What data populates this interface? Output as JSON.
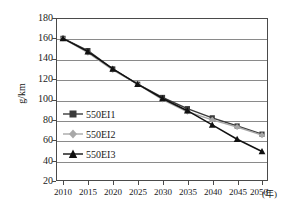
{
  "chart_data": {
    "type": "line",
    "title": "",
    "xlabel": "(年)",
    "ylabel": "g/km",
    "x": [
      2010,
      2015,
      2020,
      2025,
      2030,
      2035,
      2040,
      2045,
      2050
    ],
    "xticklabels": [
      "2010",
      "2015",
      "2020",
      "2025",
      "2030",
      "2035",
      "2040",
      "2045",
      "2050"
    ],
    "xunit": "(年)",
    "yticklabels": [
      "180",
      "160",
      "140",
      "120",
      "100",
      "80",
      "60",
      "40",
      "20"
    ],
    "yticks": [
      180,
      160,
      140,
      120,
      100,
      80,
      60,
      40,
      20
    ],
    "ylim": [
      20,
      180
    ],
    "xlim": [
      2008,
      2052
    ],
    "grid": "horizontal",
    "legend_position": "inside-left",
    "series": [
      {
        "name": "550EI1",
        "marker": "square",
        "color": "#3b3b3b",
        "values": [
          160,
          148,
          130,
          115,
          102,
          91,
          82,
          74,
          66
        ]
      },
      {
        "name": "550EI2",
        "marker": "diamond",
        "color": "#a8a8a8",
        "values": [
          160,
          146,
          129,
          115,
          100,
          88,
          80,
          73,
          65
        ]
      },
      {
        "name": "550EI3",
        "marker": "triangle",
        "color": "#111111",
        "values": [
          160,
          147,
          130,
          115,
          101,
          89,
          75,
          61,
          49
        ]
      }
    ]
  },
  "axes": {
    "y_label": "g/km",
    "y_tick_0": "180",
    "y_tick_1": "160",
    "y_tick_2": "140",
    "y_tick_3": "120",
    "y_tick_4": "100",
    "y_tick_5": "80",
    "y_tick_6": "60",
    "y_tick_7": "40",
    "y_tick_8": "20",
    "x_tick_0": "2010",
    "x_tick_1": "2015",
    "x_tick_2": "2020",
    "x_tick_3": "2025",
    "x_tick_4": "2030",
    "x_tick_5": "2035",
    "x_tick_6": "2040",
    "x_tick_7": "2045",
    "x_tick_8": "2050",
    "x_unit": "(年)"
  },
  "legend": {
    "items": [
      {
        "label": "550EI1"
      },
      {
        "label": "550EI2"
      },
      {
        "label": "550EI3"
      }
    ]
  },
  "colors": {
    "series1": "#3b3b3b",
    "series2": "#a8a8a8",
    "series3": "#111111",
    "grid": "#8a8a8a",
    "frame": "#4a4a4a",
    "text": "#1a1a1a",
    "background": "#ffffff"
  }
}
